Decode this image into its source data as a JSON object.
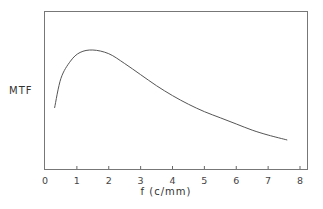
{
  "chart_data": {
    "type": "line",
    "title": "",
    "xlabel": "f (c/mm)",
    "ylabel": "MTF",
    "xlim": [
      0,
      8
    ],
    "ylim": null,
    "grid": false,
    "legend": null,
    "x_ticks": [
      "0",
      "1",
      "2",
      "3",
      "4",
      "5",
      "6",
      "7",
      "8"
    ],
    "y_ticks": [],
    "series": [
      {
        "name": "MTF",
        "x": [
          0.3,
          0.5,
          0.8,
          1.1,
          1.5,
          2.0,
          2.5,
          3.0,
          3.5,
          4.0,
          4.5,
          5.0,
          5.5,
          6.0,
          6.5,
          7.0,
          7.6
        ],
        "y": [
          0.48,
          0.72,
          0.86,
          0.93,
          0.95,
          0.92,
          0.84,
          0.75,
          0.66,
          0.58,
          0.51,
          0.45,
          0.4,
          0.35,
          0.3,
          0.26,
          0.22
        ]
      }
    ]
  }
}
